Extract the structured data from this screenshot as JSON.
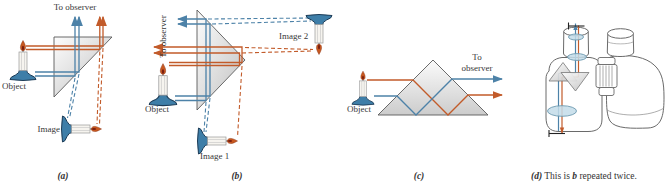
{
  "panels": {
    "a": {
      "to_observer": "To observer",
      "object_label": "Object",
      "image_label": "Image",
      "caption": "(a)"
    },
    "b": {
      "to_observer": "To observer",
      "object_label": "Object",
      "image1_label": "Image 1",
      "image2_label": "Image 2",
      "caption": "(b)"
    },
    "c": {
      "to_observer": "To observer",
      "object_label": "Object",
      "caption": "(c)"
    },
    "d": {
      "caption_marker": "(d)",
      "caption_text_1": "This is",
      "caption_emphasis": "b",
      "caption_text_2": "repeated twice."
    }
  },
  "colors": {
    "ray_orange": "#c25b2a",
    "ray_blue": "#4d82a8",
    "prism_fill_light": "#fdfdfd",
    "prism_fill_dark": "#c2c2c2",
    "prism_stroke": "#5a5a5a",
    "candle_base_blue": "#3e7ea8",
    "flame_orange": "#c8581f",
    "lens_fill": "#c3dce9",
    "lens_stroke": "#6d9ab0",
    "outline_gray": "#6a6a6a",
    "text": "#383838"
  }
}
